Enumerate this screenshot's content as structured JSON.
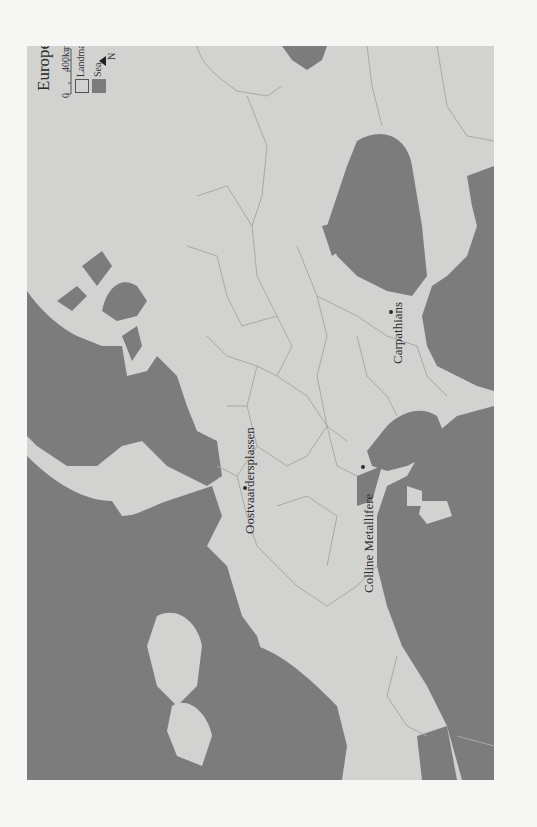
{
  "map": {
    "title": "Europe Today",
    "orientation": "rotated 90° — north points left",
    "colors": {
      "landmass": "#d2d2d0",
      "sea": "#7c7c7c",
      "border": "#a9a9a7",
      "page_background": "#f6f6f4"
    },
    "legend": {
      "scale_start": "0",
      "scale_end": "400km",
      "items": [
        {
          "label": "Landmass",
          "color": "#d2d2d0"
        },
        {
          "label": "Sea",
          "color": "#7c7c7c"
        }
      ],
      "north_label": "N"
    },
    "places": [
      {
        "name": "Oostvaardersplassen",
        "x": 247,
        "y": 487
      },
      {
        "name": "Colline Metallifere",
        "x": 365,
        "y": 491
      },
      {
        "name": "Carpathians",
        "x": 397,
        "y": 311
      }
    ]
  }
}
